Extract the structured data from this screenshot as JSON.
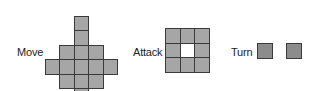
{
  "labels": {
    "move": "Move",
    "attack": "Attack",
    "turn": "Turn"
  },
  "colors": {
    "cell_fill": "#a6a6a6",
    "cell_border": "#3a3a3a",
    "turn_fill": "#8c8c8c",
    "empty": "#ffffff"
  },
  "move_grid": {
    "description": "Diamond-shaped movement range, 7 rows",
    "rows": [
      [
        0,
        0,
        1,
        0,
        0
      ],
      [
        0,
        1,
        1,
        1,
        0
      ],
      [
        1,
        1,
        1,
        1,
        1
      ],
      [
        0,
        1,
        1,
        1,
        0
      ],
      [
        0,
        0,
        1,
        0,
        0
      ]
    ]
  },
  "attack_grid": {
    "description": "3x3 ring with empty center",
    "rows": [
      [
        1,
        1,
        1
      ],
      [
        1,
        0,
        1
      ],
      [
        1,
        1,
        1
      ]
    ]
  },
  "turn": {
    "squares": 2
  }
}
